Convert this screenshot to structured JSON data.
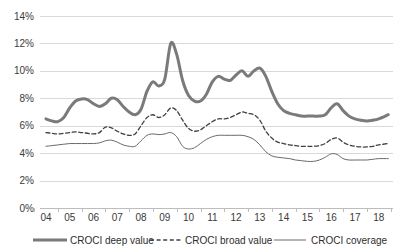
{
  "chart_data": {
    "type": "line",
    "title": "",
    "xlabel": "",
    "ylabel": "",
    "ylim": [
      0,
      14
    ],
    "ytick_labels": [
      "0%",
      "2%",
      "4%",
      "6%",
      "8%",
      "10%",
      "12%",
      "14%"
    ],
    "ytick_values": [
      0,
      2,
      4,
      6,
      8,
      10,
      12,
      14
    ],
    "grid": true,
    "legend_position": "bottom",
    "x": [
      "04",
      "05",
      "06",
      "07",
      "08",
      "09",
      "10",
      "11",
      "12",
      "13",
      "14",
      "15",
      "16",
      "17",
      "18"
    ],
    "xtick_labels": [
      "04",
      "05",
      "06",
      "07",
      "08",
      "09",
      "10",
      "11",
      "12",
      "13",
      "14",
      "15",
      "16",
      "17",
      "18"
    ],
    "series": [
      {
        "name": "CROCI deep value",
        "style": "solid-thick",
        "color": "#7a7a7a",
        "x": [
          2004.0,
          2004.25,
          2004.5,
          2004.75,
          2005.0,
          2005.25,
          2005.5,
          2005.75,
          2006.0,
          2006.25,
          2006.5,
          2006.75,
          2007.0,
          2007.25,
          2007.5,
          2007.75,
          2008.0,
          2008.25,
          2008.5,
          2008.75,
          2009.0,
          2009.25,
          2009.5,
          2009.75,
          2010.0,
          2010.25,
          2010.5,
          2010.75,
          2011.0,
          2011.25,
          2011.5,
          2011.75,
          2012.0,
          2012.25,
          2012.5,
          2012.75,
          2013.0,
          2013.25,
          2013.5,
          2013.75,
          2014.0,
          2014.25,
          2014.5,
          2014.75,
          2015.0,
          2015.25,
          2015.5,
          2015.75,
          2016.0,
          2016.25,
          2016.5,
          2016.75,
          2017.0,
          2017.25,
          2017.5,
          2017.75,
          2018.0,
          2018.4
        ],
        "values": [
          6.5,
          6.35,
          6.3,
          6.6,
          7.3,
          7.8,
          7.95,
          7.9,
          7.6,
          7.4,
          7.6,
          8.0,
          7.9,
          7.4,
          7.0,
          6.8,
          7.2,
          8.5,
          9.2,
          8.9,
          9.4,
          12.0,
          11.2,
          9.3,
          8.2,
          7.8,
          7.8,
          8.3,
          9.2,
          9.6,
          9.4,
          9.3,
          9.7,
          10.0,
          9.6,
          10.0,
          10.2,
          9.6,
          8.5,
          7.6,
          7.1,
          6.9,
          6.8,
          6.7,
          6.7,
          6.7,
          6.7,
          6.8,
          7.3,
          7.6,
          7.1,
          6.7,
          6.5,
          6.4,
          6.35,
          6.4,
          6.5,
          6.8
        ]
      },
      {
        "name": "CROCI broad value",
        "style": "dashed",
        "color": "#3f3f3f",
        "x": [
          2004.0,
          2004.25,
          2004.5,
          2004.75,
          2005.0,
          2005.25,
          2005.5,
          2005.75,
          2006.0,
          2006.25,
          2006.5,
          2006.75,
          2007.0,
          2007.25,
          2007.5,
          2007.75,
          2008.0,
          2008.25,
          2008.5,
          2008.75,
          2009.0,
          2009.25,
          2009.5,
          2009.75,
          2010.0,
          2010.25,
          2010.5,
          2010.75,
          2011.0,
          2011.25,
          2011.5,
          2011.75,
          2012.0,
          2012.25,
          2012.5,
          2012.75,
          2013.0,
          2013.25,
          2013.5,
          2013.75,
          2014.0,
          2014.25,
          2014.5,
          2014.75,
          2015.0,
          2015.25,
          2015.5,
          2015.75,
          2016.0,
          2016.25,
          2016.5,
          2016.75,
          2017.0,
          2017.25,
          2017.5,
          2017.75,
          2018.0,
          2018.4
        ],
        "values": [
          5.5,
          5.45,
          5.4,
          5.45,
          5.5,
          5.55,
          5.5,
          5.45,
          5.4,
          5.5,
          5.9,
          5.85,
          5.6,
          5.4,
          5.3,
          5.4,
          6.0,
          6.6,
          6.8,
          6.6,
          6.8,
          7.3,
          7.1,
          6.4,
          5.8,
          5.6,
          5.7,
          6.0,
          6.3,
          6.5,
          6.5,
          6.6,
          6.8,
          7.0,
          6.9,
          6.8,
          6.4,
          5.6,
          5.1,
          4.8,
          4.7,
          4.6,
          4.55,
          4.5,
          4.5,
          4.5,
          4.55,
          4.7,
          5.0,
          5.1,
          4.8,
          4.6,
          4.5,
          4.45,
          4.45,
          4.5,
          4.6,
          4.7
        ]
      },
      {
        "name": "CROCI coverage",
        "style": "solid-thin",
        "color": "#6a6a6a",
        "x": [
          2004.0,
          2004.25,
          2004.5,
          2004.75,
          2005.0,
          2005.25,
          2005.5,
          2005.75,
          2006.0,
          2006.25,
          2006.5,
          2006.75,
          2007.0,
          2007.25,
          2007.5,
          2007.75,
          2008.0,
          2008.25,
          2008.5,
          2008.75,
          2009.0,
          2009.25,
          2009.5,
          2009.75,
          2010.0,
          2010.25,
          2010.5,
          2010.75,
          2011.0,
          2011.25,
          2011.5,
          2011.75,
          2012.0,
          2012.25,
          2012.5,
          2012.75,
          2013.0,
          2013.25,
          2013.5,
          2013.75,
          2014.0,
          2014.25,
          2014.5,
          2014.75,
          2015.0,
          2015.25,
          2015.5,
          2015.75,
          2016.0,
          2016.25,
          2016.5,
          2016.75,
          2017.0,
          2017.25,
          2017.5,
          2017.75,
          2018.0,
          2018.4
        ],
        "values": [
          4.5,
          4.55,
          4.6,
          4.65,
          4.7,
          4.7,
          4.7,
          4.7,
          4.7,
          4.75,
          4.9,
          4.95,
          4.8,
          4.6,
          4.5,
          4.5,
          4.9,
          5.3,
          5.4,
          5.35,
          5.4,
          5.5,
          5.2,
          4.5,
          4.3,
          4.4,
          4.7,
          5.0,
          5.2,
          5.3,
          5.3,
          5.3,
          5.3,
          5.3,
          5.2,
          5.0,
          4.6,
          4.1,
          3.8,
          3.7,
          3.65,
          3.6,
          3.5,
          3.45,
          3.4,
          3.4,
          3.5,
          3.7,
          3.95,
          3.9,
          3.6,
          3.5,
          3.5,
          3.5,
          3.5,
          3.55,
          3.6,
          3.6
        ]
      }
    ]
  },
  "legend": {
    "items": [
      {
        "label": "CROCI deep value",
        "swatch": "solid-thick"
      },
      {
        "label": "CROCI broad value",
        "swatch": "dashed"
      },
      {
        "label": "CROCI coverage",
        "swatch": "solid-thin"
      }
    ]
  }
}
